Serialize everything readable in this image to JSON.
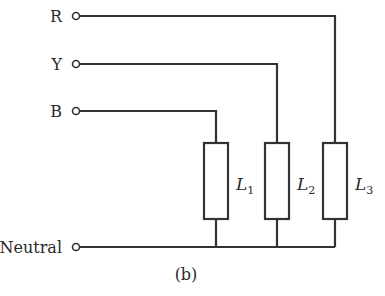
{
  "diagram": {
    "type": "three-phase star-connected load circuit",
    "caption": "(b)",
    "terminals": [
      {
        "id": "R",
        "label": "R"
      },
      {
        "id": "Y",
        "label": "Y"
      },
      {
        "id": "B",
        "label": "B"
      },
      {
        "id": "N",
        "label": "Neutral"
      }
    ],
    "loads": [
      {
        "id": "L1",
        "symbol": "L",
        "subscript": "1",
        "connected_to": "B"
      },
      {
        "id": "L2",
        "symbol": "L",
        "subscript": "2",
        "connected_to": "Y"
      },
      {
        "id": "L3",
        "symbol": "L",
        "subscript": "3",
        "connected_to": "R"
      }
    ],
    "line_color": "#333333"
  }
}
